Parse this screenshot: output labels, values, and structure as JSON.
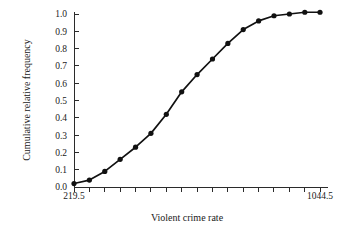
{
  "chart_data": {
    "type": "line",
    "title": "",
    "subtitle": "",
    "xlabel": "Violent crime rate",
    "ylabel": "Cumulative relative frequency",
    "xlim": [
      219.5,
      1044.5
    ],
    "ylim": [
      0.0,
      1.0
    ],
    "grid": false,
    "legend": "none",
    "x_tick_labels": [
      "219.5",
      "1044.5"
    ],
    "x_tick_label_values": [
      219.5,
      1044.5
    ],
    "x_tick_count": 17,
    "y_tick_labels": [
      "0.0",
      "0.1",
      "0.2",
      "0.3",
      "0.4",
      "0.5",
      "0.6",
      "0.7",
      "0.8",
      "0.9",
      "1.0"
    ],
    "y_tick_values": [
      0.0,
      0.1,
      0.2,
      0.3,
      0.4,
      0.5,
      0.6,
      0.7,
      0.8,
      0.9,
      1.0
    ],
    "marker": "filled-circle",
    "series": [
      {
        "name": "Cumulative relative frequency",
        "x": [
          219.5,
          271.1,
          322.7,
          374.3,
          425.9,
          477.5,
          529.1,
          580.7,
          632.3,
          683.9,
          735.5,
          787.1,
          838.7,
          890.3,
          941.9,
          993.5,
          1044.5
        ],
        "values": [
          0.02,
          0.04,
          0.09,
          0.16,
          0.23,
          0.31,
          0.42,
          0.55,
          0.65,
          0.74,
          0.83,
          0.91,
          0.96,
          0.99,
          1.0,
          1.01,
          1.01
        ]
      }
    ]
  },
  "axis": {
    "x_label_left": "219.5",
    "x_label_right": "1044.5",
    "x_title": "Violent crime rate",
    "y_title": "Cumulative relative frequency"
  },
  "colors": {
    "line": "#111111",
    "marker": "#111111",
    "axis": "#2b2b2b",
    "text": "#1a1a1a",
    "background": "#ffffff"
  }
}
